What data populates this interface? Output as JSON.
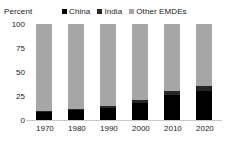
{
  "chart_data": {
    "type": "bar",
    "subtype": "stacked-bar-100",
    "title": "",
    "xlabel": "",
    "ylabel": "Percent",
    "ylim": [
      0,
      100
    ],
    "yticks": [
      0,
      25,
      50,
      75,
      100
    ],
    "ytick_labels": [
      "0",
      "25",
      "50",
      "75",
      "100"
    ],
    "categories": [
      "1970",
      "1980",
      "1990",
      "2000",
      "2010",
      "2020"
    ],
    "grid": false,
    "legend_position": "top",
    "series": [
      {
        "name": "China",
        "color": "#000000",
        "values": [
          8,
          10,
          13,
          18,
          26,
          30
        ]
      },
      {
        "name": "India",
        "color": "#262626",
        "values": [
          1,
          1.5,
          2,
          3,
          4,
          5
        ]
      },
      {
        "name": "Other EMDEs",
        "color": "#a6a6a6",
        "values": [
          91,
          88.5,
          85,
          79,
          70,
          65
        ]
      }
    ]
  },
  "axis": {
    "y_title": "Percent"
  },
  "legend": {
    "items": [
      {
        "label": "China",
        "swatch": "legend-swatch-china"
      },
      {
        "label": "India",
        "swatch": "legend-swatch-india"
      },
      {
        "label": "Other EMDEs",
        "swatch": "legend-swatch-other"
      }
    ]
  },
  "colors": {
    "china": "#000000",
    "india": "#262626",
    "other_emdes": "#a6a6a6",
    "axis_line": "#c9c9c9",
    "text": "#1a1a1a",
    "background": "#ffffff"
  }
}
